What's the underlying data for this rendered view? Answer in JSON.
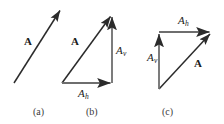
{
  "figure": {
    "width": 224,
    "height": 124,
    "background": "#ffffff",
    "stroke_color": "#2b2b2b",
    "text_color": "#1a1a1a",
    "caption_color": "#3a3a3a",
    "panels": [
      {
        "id": "a",
        "caption": "(a)",
        "caption_x": 33,
        "caption_y": 107,
        "arrows": [
          {
            "name": "vector-A",
            "label": "A",
            "label_style": "bold",
            "x1": 14,
            "y1": 83,
            "x2": 61,
            "y2": 9,
            "label_x": 24,
            "label_y": 36
          }
        ]
      },
      {
        "id": "b",
        "caption": "(b)",
        "caption_x": 86,
        "caption_y": 107,
        "arrows": [
          {
            "name": "vector-A",
            "label": "A",
            "label_style": "bold",
            "x1": 62,
            "y1": 83,
            "x2": 111,
            "y2": 15,
            "label_x": 71,
            "label_y": 36
          },
          {
            "name": "component-Ah",
            "label": "A",
            "sublabel": "h",
            "label_style": "italic",
            "x1": 62,
            "y1": 83,
            "x2": 112,
            "y2": 83,
            "label_x": 78,
            "label_y": 88
          },
          {
            "name": "component-Av",
            "label": "A",
            "sublabel": "v",
            "label_style": "italic",
            "x1": 112,
            "y1": 83,
            "x2": 112,
            "y2": 15,
            "label_x": 116,
            "label_y": 45
          }
        ]
      },
      {
        "id": "c",
        "caption": "(c)",
        "caption_x": 162,
        "caption_y": 107,
        "arrows": [
          {
            "name": "vector-A",
            "label": "A",
            "label_style": "bold",
            "x1": 159,
            "y1": 89,
            "x2": 211,
            "y2": 33,
            "label_x": 194,
            "label_y": 58
          },
          {
            "name": "component-Av",
            "label": "A",
            "sublabel": "v",
            "label_style": "italic",
            "x1": 159,
            "y1": 89,
            "x2": 159,
            "y2": 32,
            "label_x": 147,
            "label_y": 52
          },
          {
            "name": "component-Ah",
            "label": "A",
            "sublabel": "h",
            "label_style": "italic",
            "x1": 159,
            "y1": 32,
            "x2": 211,
            "y2": 32,
            "label_x": 178,
            "label_y": 15
          }
        ]
      }
    ]
  }
}
